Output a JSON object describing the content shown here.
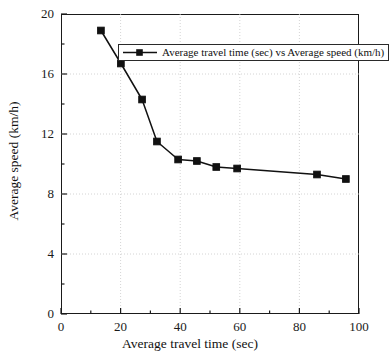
{
  "chart_data": {
    "type": "line",
    "title": "",
    "xlabel": "Average travel time (sec)",
    "ylabel": "Average speed (km/h)",
    "xlim": [
      0,
      100
    ],
    "ylim": [
      0,
      20
    ],
    "xticks": [
      0,
      20,
      40,
      60,
      80,
      100
    ],
    "yticks": [
      0,
      4,
      8,
      12,
      16,
      20
    ],
    "xtick_labels": [
      "0",
      "20",
      "40",
      "60",
      "80",
      "100"
    ],
    "ytick_labels": [
      "0",
      "4",
      "8",
      "12",
      "16",
      "20"
    ],
    "x_minor_step": 10,
    "y_minor_step": 2,
    "grid": true,
    "grid_style": "dotted",
    "legend_position": "upper-center",
    "marker": "square",
    "marker_color": "#111111",
    "line_color": "#111111",
    "series": [
      {
        "name": "Average travel time (sec) vs Average speed (km/h)",
        "x": [
          13.4,
          20.1,
          27.2,
          32.2,
          39.3,
          45.6,
          52.1,
          59.1,
          85.9,
          95.6
        ],
        "y": [
          18.9,
          16.7,
          14.3,
          11.5,
          10.3,
          10.2,
          9.8,
          9.7,
          9.3,
          9.0
        ]
      }
    ]
  },
  "axis": {
    "x_title": "Average travel time (sec)",
    "y_title": "Average speed (km/h)"
  },
  "legend": {
    "entries": [
      {
        "label": "Average travel time (sec) vs Average speed (km/h)"
      }
    ]
  }
}
